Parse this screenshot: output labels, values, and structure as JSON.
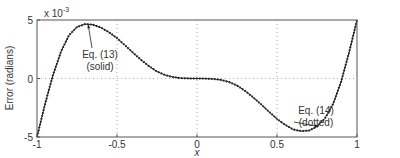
{
  "chart_data": {
    "type": "line",
    "title": "",
    "xlabel": "x",
    "ylabel": "Error (radians)",
    "y_scale_label": "x 10",
    "y_scale_exponent": "-3",
    "xlim": [
      -1,
      1
    ],
    "ylim": [
      -5,
      5
    ],
    "xticks": [
      -1,
      -0.5,
      0,
      0.5,
      1
    ],
    "xtick_labels": [
      "-1",
      "-0.5",
      "0",
      "0.5",
      "1"
    ],
    "yticks": [
      -5,
      0,
      5
    ],
    "ytick_labels": [
      "-5",
      "0",
      "5"
    ],
    "grid": "dotted",
    "series": [
      {
        "name": "Eq. (13) (solid)",
        "style": "solid",
        "x": [
          -1,
          -0.95,
          -0.9,
          -0.85,
          -0.8,
          -0.75,
          -0.7,
          -0.65,
          -0.6,
          -0.55,
          -0.5,
          -0.45,
          -0.4,
          -0.35,
          -0.3,
          -0.25,
          -0.2,
          -0.15,
          -0.1,
          -0.05,
          0,
          0.05,
          0.1,
          0.15,
          0.2,
          0.25,
          0.3,
          0.35,
          0.4,
          0.45,
          0.5,
          0.55,
          0.6,
          0.65,
          0.7,
          0.75,
          0.8,
          0.85,
          0.9,
          0.95,
          1
        ],
        "values": [
          -5,
          -2.2,
          0.3,
          2.3,
          3.7,
          4.4,
          4.65,
          4.6,
          4.35,
          3.95,
          3.45,
          2.85,
          2.2,
          1.6,
          1.05,
          0.6,
          0.3,
          0.12,
          0.03,
          0.005,
          0,
          -0.005,
          -0.03,
          -0.12,
          -0.3,
          -0.6,
          -1.05,
          -1.6,
          -2.2,
          -2.85,
          -3.45,
          -3.95,
          -4.35,
          -4.5,
          -4.45,
          -4.1,
          -3.4,
          -2.2,
          -0.3,
          2.2,
          5
        ]
      },
      {
        "name": "Eq. (14) (dotted)",
        "style": "dotted",
        "x": [
          -1,
          -0.95,
          -0.9,
          -0.85,
          -0.8,
          -0.75,
          -0.7,
          -0.65,
          -0.6,
          -0.55,
          -0.5,
          -0.45,
          -0.4,
          -0.35,
          -0.3,
          -0.25,
          -0.2,
          -0.15,
          -0.1,
          -0.05,
          0,
          0.05,
          0.1,
          0.15,
          0.2,
          0.25,
          0.3,
          0.35,
          0.4,
          0.45,
          0.5,
          0.55,
          0.6,
          0.65,
          0.7,
          0.75,
          0.8,
          0.85,
          0.9,
          0.95,
          1
        ],
        "values": [
          -5,
          -2.2,
          0.3,
          2.3,
          3.7,
          4.4,
          4.65,
          4.6,
          4.35,
          3.95,
          3.45,
          2.85,
          2.2,
          1.6,
          1.05,
          0.6,
          0.3,
          0.12,
          0.03,
          0.005,
          0,
          -0.005,
          -0.03,
          -0.12,
          -0.3,
          -0.6,
          -1.05,
          -1.6,
          -2.2,
          -2.85,
          -3.45,
          -3.95,
          -4.35,
          -4.5,
          -4.45,
          -4.1,
          -3.4,
          -2.2,
          -0.3,
          2.2,
          5
        ]
      }
    ],
    "annotations": [
      {
        "line1": "Eq. (13)",
        "line2": "(solid)",
        "points_to": [
          -0.68,
          4.6
        ]
      },
      {
        "line1": "Eq. (14)",
        "line2": "(dotted)",
        "points_to": [
          0.76,
          -4.1
        ]
      }
    ]
  }
}
